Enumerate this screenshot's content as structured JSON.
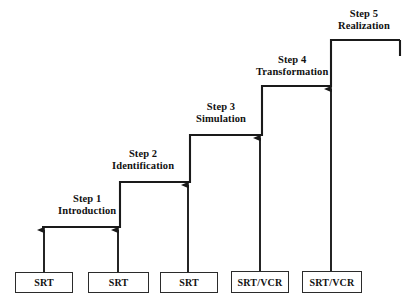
{
  "diagram": {
    "type": "staircase-progression",
    "title": "",
    "line_color": "#1a1a1a",
    "box_border_color": "#2b2b2b",
    "background_color": "#ffffff",
    "text_color": "#111111",
    "steps": [
      {
        "index": 1,
        "number_label": "Step 1",
        "name_label": "Introduction",
        "source_label": "SRT",
        "label_x": 58,
        "label_y": 193,
        "tread_y": 227,
        "tread_x1": 42,
        "tread_x2": 120
      },
      {
        "index": 2,
        "number_label": "Step 2",
        "name_label": "Identification",
        "source_label": "SRT",
        "label_x": 112,
        "label_y": 148,
        "tread_y": 182,
        "tread_x1": 120,
        "tread_x2": 190
      },
      {
        "index": 3,
        "number_label": "Step 3",
        "name_label": "Simulation",
        "source_label": "SRT",
        "label_x": 196,
        "label_y": 101,
        "tread_y": 135,
        "tread_x1": 190,
        "tread_x2": 262
      },
      {
        "index": 4,
        "number_label": "Step 4",
        "name_label": "Transformation",
        "source_label": "SRT/VCR",
        "label_x": 256,
        "label_y": 54,
        "tread_y": 86,
        "tread_x1": 262,
        "tread_x2": 331
      },
      {
        "index": 5,
        "number_label": "Step 5",
        "name_label": "Realization",
        "source_label": "SRT/VCR",
        "label_x": 338,
        "label_y": 8,
        "tread_y": 40,
        "tread_x1": 331,
        "tread_x2": 400
      }
    ],
    "boxes": [
      {
        "label": "SRT",
        "x": 15,
        "y": 272,
        "w": 58,
        "h": 21
      },
      {
        "label": "SRT",
        "x": 88,
        "y": 272,
        "w": 61,
        "h": 21
      },
      {
        "label": "SRT",
        "x": 160,
        "y": 272,
        "w": 58,
        "h": 21
      },
      {
        "label": "SRT/VCR",
        "x": 231,
        "y": 271,
        "w": 58,
        "h": 22
      },
      {
        "label": "SRT/VCR",
        "x": 302,
        "y": 271,
        "w": 60,
        "h": 22
      }
    ],
    "arrows": [
      {
        "x": 44,
        "y_tail": 272,
        "y_head": 230,
        "target_step": 1
      },
      {
        "x": 118,
        "y_tail": 272,
        "y_head": 230,
        "target_step": 1
      },
      {
        "x": 188,
        "y_tail": 272,
        "y_head": 185,
        "target_step": 2
      },
      {
        "x": 260,
        "y_tail": 271,
        "y_head": 138,
        "target_step": 3
      },
      {
        "x": 331,
        "y_tail": 271,
        "y_head": 89,
        "target_step": 4
      }
    ],
    "end_tick": {
      "x": 400,
      "y1": 40,
      "y2": 56
    }
  }
}
